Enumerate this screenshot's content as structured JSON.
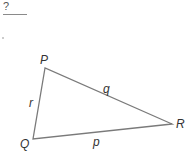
{
  "header": {
    "question_mark": "?"
  },
  "triangle": {
    "vertices": [
      {
        "label": "P",
        "x": 45,
        "y": 68
      },
      {
        "label": "Q",
        "x": 33,
        "y": 139
      },
      {
        "label": "R",
        "x": 172,
        "y": 124
      }
    ],
    "sides": [
      {
        "label": "r",
        "between": "P-Q"
      },
      {
        "label": "q",
        "between": "P-R"
      },
      {
        "label": "p",
        "between": "Q-R"
      }
    ],
    "stroke_color": "#7a7a7a"
  }
}
